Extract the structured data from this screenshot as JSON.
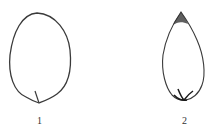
{
  "figure": {
    "items": [
      {
        "id": 1,
        "label": "1",
        "shape": "ovate outline with basal stalk"
      },
      {
        "id": 2,
        "label": "2",
        "shape": "acuminate teardrop outline with dark tip and base"
      }
    ],
    "colors": {
      "stroke": "#3a3a3a",
      "dark_accent": "#1a1a1a",
      "background": "#ffffff"
    }
  }
}
